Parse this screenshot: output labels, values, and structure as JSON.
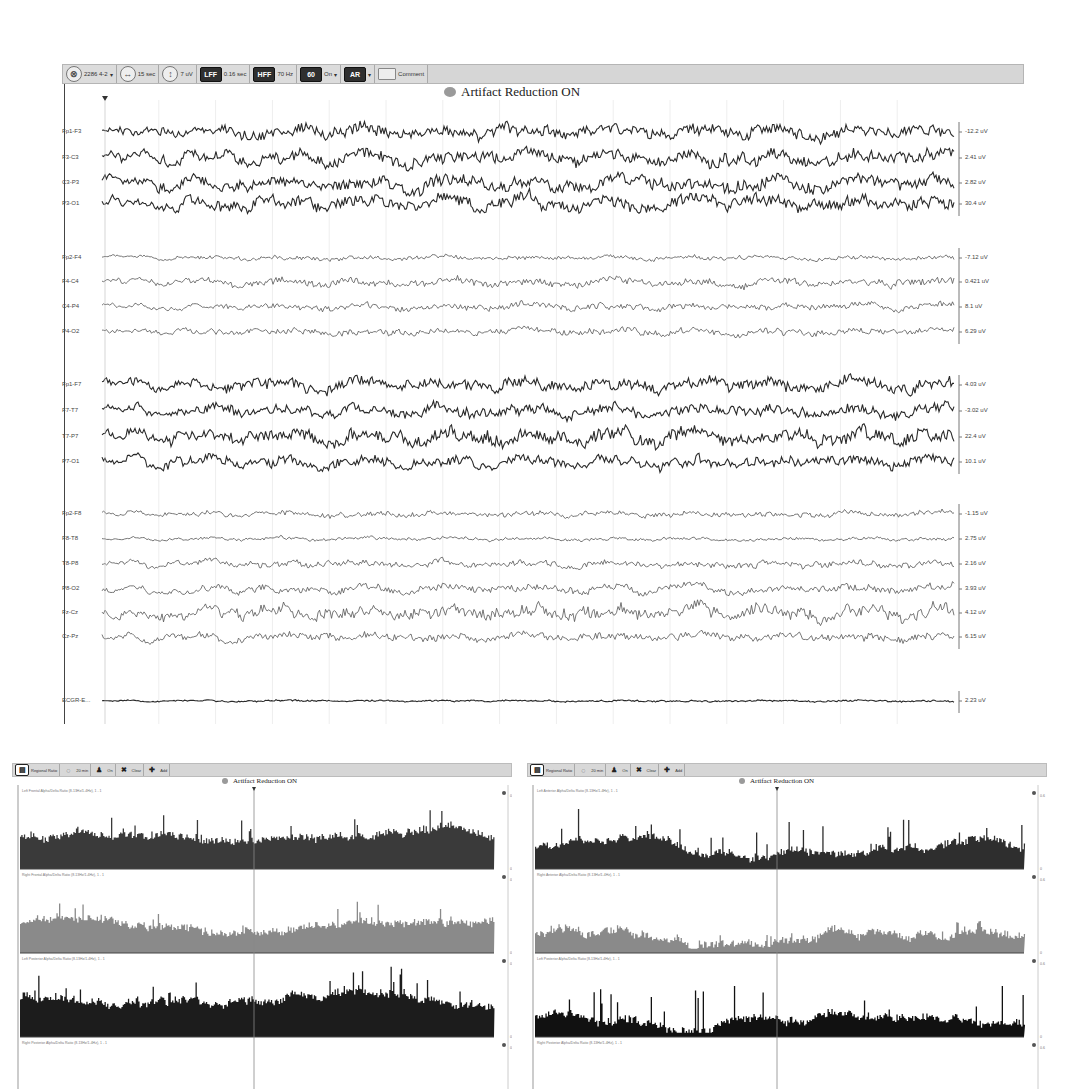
{
  "eeg_window": {
    "toolbar": {
      "montage": {
        "icon": "montage-icon",
        "label": "2286 4-2"
      },
      "timebase": {
        "icon": "timebase-icon",
        "label": "15 sec"
      },
      "sensitivity": {
        "icon": "sensitivity-icon",
        "label": "7 uV"
      },
      "lff": {
        "icon": "LFF",
        "label": "0.16 sec"
      },
      "hff": {
        "icon": "HFF",
        "label": "70 Hz"
      },
      "notch": {
        "icon": "60",
        "label": "On"
      },
      "artifact_reduction": {
        "icon": "AR"
      },
      "comment": {
        "icon": "comment-icon",
        "label": "Comment"
      }
    },
    "banner": "Artifact Reduction ON",
    "channel_groups": [
      {
        "channels": [
          {
            "name": "Fp1-F3",
            "scale": "-12.2 uV",
            "amp": 11,
            "style": "dark"
          },
          {
            "name": "F3-C3",
            "scale": "2.41 uV",
            "amp": 12,
            "style": "dark"
          },
          {
            "name": "C3-P3",
            "scale": "2.82 uV",
            "amp": 12,
            "style": "dark"
          },
          {
            "name": "P3-O1",
            "scale": "30.4 uV",
            "amp": 12,
            "style": "dark"
          }
        ]
      },
      {
        "channels": [
          {
            "name": "Fp2-F4",
            "scale": "-7.12 uV",
            "amp": 4,
            "style": "light"
          },
          {
            "name": "F4-C4",
            "scale": "0.421 uV",
            "amp": 7,
            "style": "light"
          },
          {
            "name": "C4-P4",
            "scale": "8.1 uV",
            "amp": 6,
            "style": "light"
          },
          {
            "name": "P4-O2",
            "scale": "6.29 uV",
            "amp": 6,
            "style": "light"
          }
        ]
      },
      {
        "channels": [
          {
            "name": "Fp1-F7",
            "scale": "4.03 uV",
            "amp": 11,
            "style": "dark"
          },
          {
            "name": "F7-T7",
            "scale": "-3.02 uV",
            "amp": 10,
            "style": "dark"
          },
          {
            "name": "T7-P7",
            "scale": "22.4 uV",
            "amp": 13,
            "style": "dark"
          },
          {
            "name": "P7-O1",
            "scale": "10.1 uV",
            "amp": 10,
            "style": "dark"
          }
        ]
      },
      {
        "channels": [
          {
            "name": "Fp2-F8",
            "scale": "-1.15 uV",
            "amp": 5,
            "style": "light"
          },
          {
            "name": "F8-T8",
            "scale": "2.75 uV",
            "amp": 3,
            "style": "light"
          },
          {
            "name": "T8-P8",
            "scale": "2.16 uV",
            "amp": 6,
            "style": "light"
          },
          {
            "name": "P8-O2",
            "scale": "3.93 uV",
            "amp": 7,
            "style": "light"
          },
          {
            "name": "Fz-Cz",
            "scale": "4.12 uV",
            "amp": 12,
            "style": "light"
          },
          {
            "name": "Cz-Pz",
            "scale": "6.15 uV",
            "amp": 7,
            "style": "light"
          }
        ]
      },
      {
        "channels": [
          {
            "name": "ECGR-E...",
            "scale": "2.23 uV",
            "amp": 1.5,
            "style": "dark"
          }
        ]
      }
    ]
  },
  "trend_windows": [
    {
      "id": "left",
      "toolbar": {
        "items": [
          {
            "icon": "panels-icon",
            "label": "Regional Ratio"
          },
          {
            "icon": "timebase-icon",
            "label": "20 min"
          },
          {
            "icon": "person-icon",
            "label": "On"
          },
          {
            "icon": "close-x-icon",
            "label": "Clear"
          },
          {
            "icon": "plus-icon",
            "label": "Add"
          }
        ]
      },
      "banner": "Artifact Reduction ON",
      "panels": [
        {
          "title": "Left Frontal Alpha/Delta Ratio (8-13Hz/1-4Hz), 1 - 1",
          "scale_top": "0.1",
          "scale_bottom": "0",
          "color": "#3a3a3a",
          "level": 0.35,
          "spread": 0.3
        },
        {
          "title": "Right Frontal Alpha/Delta Ratio (8-13Hz/1-4Hz), 1 - 1",
          "scale_top": "0.1",
          "scale_bottom": "0",
          "color": "#8a8a8a",
          "level": 0.28,
          "spread": 0.22
        },
        {
          "title": "Left Posterior Alpha/Delta Ratio (8-13Hz/1-4Hz), 1 - 1",
          "scale_top": "0.1",
          "scale_bottom": "0",
          "color": "#1c1c1c",
          "level": 0.4,
          "spread": 0.35
        },
        {
          "title": "Right Posterior Alpha/Delta Ratio (8-13Hz/1-4Hz), 1 - 1",
          "scale_top": "0.1",
          "scale_bottom": "0",
          "color": "#1c1c1c",
          "level": 0.0,
          "spread": 0.0
        }
      ]
    },
    {
      "id": "right",
      "toolbar": {
        "items": [
          {
            "icon": "panels-icon",
            "label": "Regional Ratio"
          },
          {
            "icon": "timebase-icon",
            "label": "20 min"
          },
          {
            "icon": "person-icon",
            "label": "On"
          },
          {
            "icon": "close-x-icon",
            "label": "Clear"
          },
          {
            "icon": "plus-icon",
            "label": "Add"
          }
        ]
      },
      "banner": "Artifact Reduction ON",
      "panels": [
        {
          "title": "Left Anterior Alpha/Delta Ratio (8-13Hz/1-4Hz), 1 - 1",
          "scale_top": "0.6",
          "scale_bottom": "0",
          "color": "#2e2e2e",
          "level": 0.2,
          "spread": 0.45
        },
        {
          "title": "Right Anterior Alpha/Delta Ratio (8-13Hz/1-4Hz), 1 - 1",
          "scale_top": "0.6",
          "scale_bottom": "0",
          "color": "#8a8a8a",
          "level": 0.14,
          "spread": 0.12
        },
        {
          "title": "Left Posterior Alpha/Delta Ratio (8-13Hz/1-4Hz), 1 - 1",
          "scale_top": "0.6",
          "scale_bottom": "0",
          "color": "#111111",
          "level": 0.18,
          "spread": 0.55
        },
        {
          "title": "Right Posterior Alpha/Delta Ratio (8-13Hz/1-4Hz), 1 - 1",
          "scale_top": "0.6",
          "scale_bottom": "0",
          "color": "#111111",
          "level": 0.0,
          "spread": 0.0
        }
      ]
    }
  ]
}
